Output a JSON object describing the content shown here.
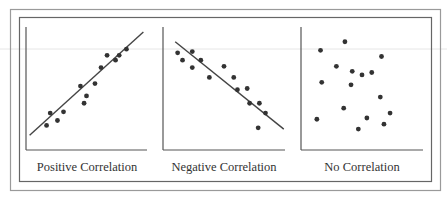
{
  "figure": {
    "border_color": "#9a9a9a",
    "inner_border_color": "#666666",
    "axis_color": "#555555",
    "dot_color": "#333333",
    "line_color": "#444444"
  },
  "chart_data": [
    {
      "type": "scatter",
      "title": "Positive Correlation",
      "xlabel": "",
      "ylabel": "",
      "grid": false,
      "trendline": {
        "from": [
          0.03,
          0.12
        ],
        "to": [
          0.97,
          0.96
        ]
      },
      "points": [
        [
          0.17,
          0.2
        ],
        [
          0.2,
          0.3
        ],
        [
          0.26,
          0.24
        ],
        [
          0.31,
          0.31
        ],
        [
          0.45,
          0.52
        ],
        [
          0.5,
          0.44
        ],
        [
          0.48,
          0.38
        ],
        [
          0.57,
          0.54
        ],
        [
          0.62,
          0.67
        ],
        [
          0.67,
          0.77
        ],
        [
          0.74,
          0.73
        ],
        [
          0.77,
          0.77
        ],
        [
          0.83,
          0.82
        ]
      ],
      "xlim": [
        0,
        1
      ],
      "ylim": [
        0,
        1
      ]
    },
    {
      "type": "scatter",
      "title": "Negative Correlation",
      "xlabel": "",
      "ylabel": "",
      "grid": false,
      "trendline": {
        "from": [
          0.1,
          0.88
        ],
        "to": [
          0.99,
          0.17
        ]
      },
      "points": [
        [
          0.12,
          0.79
        ],
        [
          0.16,
          0.73
        ],
        [
          0.24,
          0.8
        ],
        [
          0.24,
          0.67
        ],
        [
          0.31,
          0.73
        ],
        [
          0.38,
          0.59
        ],
        [
          0.5,
          0.68
        ],
        [
          0.58,
          0.59
        ],
        [
          0.61,
          0.49
        ],
        [
          0.69,
          0.5
        ],
        [
          0.71,
          0.38
        ],
        [
          0.79,
          0.38
        ],
        [
          0.84,
          0.3
        ],
        [
          0.78,
          0.18
        ]
      ],
      "xlim": [
        0,
        1
      ],
      "ylim": [
        0,
        1
      ]
    },
    {
      "type": "scatter",
      "title": "No Correlation",
      "xlabel": "",
      "ylabel": "",
      "grid": false,
      "trendline": null,
      "points": [
        [
          0.16,
          0.81
        ],
        [
          0.36,
          0.88
        ],
        [
          0.66,
          0.76
        ],
        [
          0.29,
          0.68
        ],
        [
          0.42,
          0.64
        ],
        [
          0.5,
          0.61
        ],
        [
          0.58,
          0.63
        ],
        [
          0.17,
          0.55
        ],
        [
          0.41,
          0.53
        ],
        [
          0.65,
          0.43
        ],
        [
          0.35,
          0.34
        ],
        [
          0.73,
          0.3
        ],
        [
          0.13,
          0.25
        ],
        [
          0.54,
          0.26
        ],
        [
          0.68,
          0.21
        ],
        [
          0.47,
          0.17
        ]
      ],
      "xlim": [
        0,
        1
      ],
      "ylim": [
        0,
        1
      ]
    }
  ],
  "labels": {
    "positive": "Positive Correlation",
    "negative": "Negative Correlation",
    "none": "No Correlation"
  }
}
